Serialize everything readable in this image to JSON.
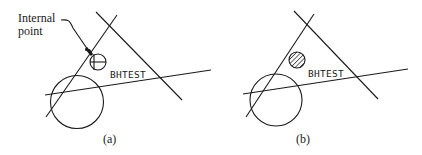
{
  "figure": {
    "panels": [
      {
        "id": "a",
        "caption": "(a)",
        "label": "BHTEST",
        "annotation": {
          "line1": "Internal",
          "line2": "point"
        },
        "marker": "internal-point-crosshair-circle"
      },
      {
        "id": "b",
        "caption": "(b)",
        "label": "BHTEST",
        "marker": "hatched-circle"
      }
    ],
    "colors": {
      "stroke": "#1a1a1a",
      "background": "#ffffff"
    }
  }
}
